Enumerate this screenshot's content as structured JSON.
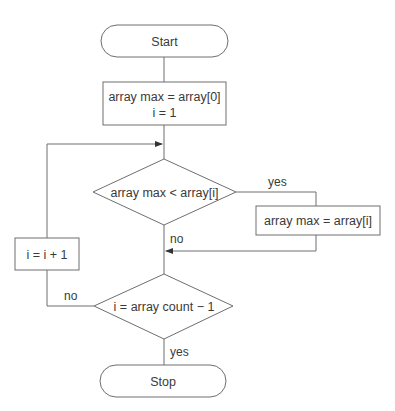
{
  "diagram": {
    "type": "flowchart",
    "colors": {
      "stroke": "#6e6e6e",
      "text": "#3a3a3a",
      "background": "#ffffff"
    },
    "nodes": {
      "start": {
        "shape": "terminal",
        "label": "Start"
      },
      "init": {
        "shape": "process",
        "lines": [
          "array max = array[0]",
          "i = 1"
        ]
      },
      "compare": {
        "shape": "decision",
        "label": "array max < array[i]"
      },
      "update_max": {
        "shape": "process",
        "label": "array max = array[i]"
      },
      "check_end": {
        "shape": "decision",
        "label": "i = array count − 1"
      },
      "increment": {
        "shape": "process",
        "label": "i = i + 1"
      },
      "stop": {
        "shape": "terminal",
        "label": "Stop"
      }
    },
    "edges": {
      "compare_yes": {
        "from": "compare",
        "to": "update_max",
        "label": "yes"
      },
      "compare_no": {
        "from": "compare",
        "to": "check_end",
        "label": "no"
      },
      "check_end_no": {
        "from": "check_end",
        "to": "increment",
        "label": "no"
      },
      "check_end_yes": {
        "from": "check_end",
        "to": "stop",
        "label": "yes"
      }
    }
  }
}
